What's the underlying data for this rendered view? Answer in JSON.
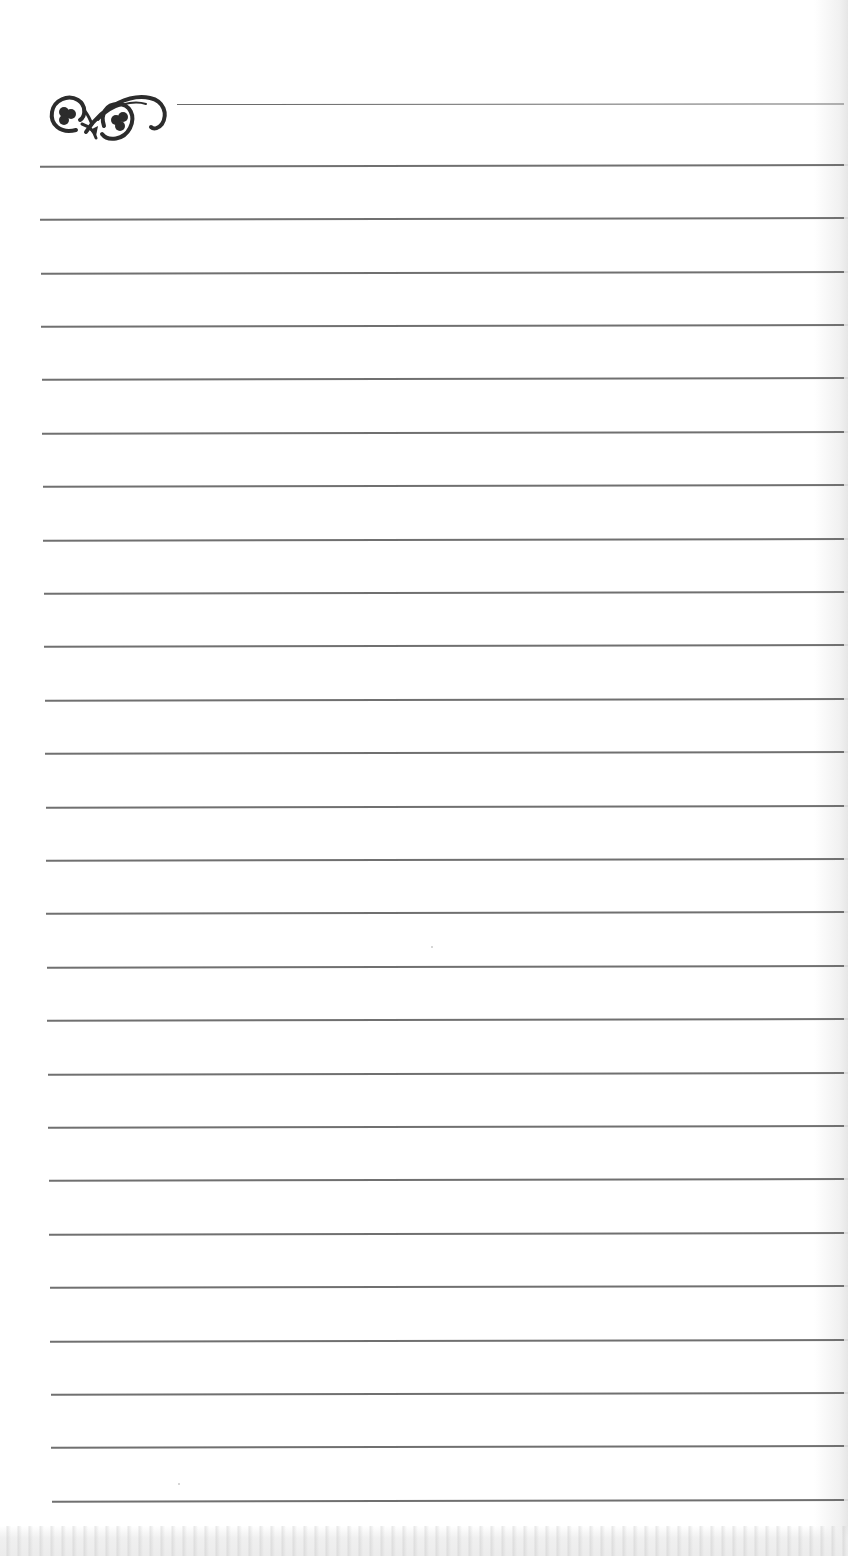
{
  "page": {
    "type": "lined notebook page",
    "background_color": "#ffffff",
    "rule_color": "#707070",
    "ornament": {
      "icon": "scroll-flourish-icon",
      "description": "decorative swirl with two trefoil spirals"
    },
    "header_rule": {
      "y": 104,
      "x_start": 177
    },
    "rule_count": 26,
    "rule_spacing_px": 53.4,
    "first_rule_y": 165,
    "rules_y": [
      165,
      218,
      272,
      325,
      378,
      432,
      485,
      539,
      592,
      645,
      699,
      752,
      806,
      859,
      912,
      966,
      1019,
      1073,
      1126,
      1179,
      1233,
      1286,
      1340,
      1393,
      1446,
      1500
    ],
    "rules_x_start": [
      40,
      40,
      41,
      41,
      42,
      42,
      43,
      43,
      44,
      44,
      45,
      45,
      46,
      46,
      46,
      47,
      47,
      48,
      48,
      49,
      49,
      50,
      50,
      51,
      51,
      52
    ],
    "bottom_bleed_text": ""
  }
}
